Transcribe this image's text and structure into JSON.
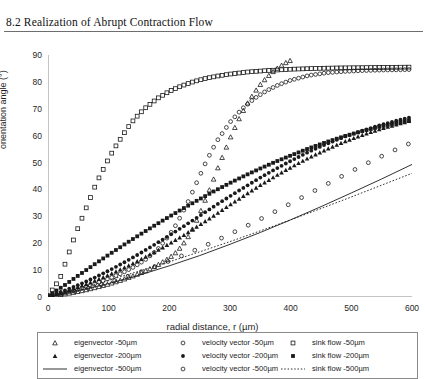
{
  "page": {
    "chapter_title": "8.2  Realization of Abrupt Contraction Flow"
  },
  "chart_data": {
    "type": "scatter",
    "title": "",
    "xlabel": "radial distance, r (µm)",
    "ylabel": "orientation angle (°)",
    "xlim": [
      0,
      600
    ],
    "ylim": [
      0,
      90
    ],
    "xticks": [
      0,
      100,
      200,
      300,
      400,
      500,
      600
    ],
    "yticks": [
      0,
      10,
      20,
      30,
      40,
      50,
      60,
      70,
      80,
      90
    ],
    "grid": false,
    "legend_position": "below-plot",
    "series": [
      {
        "name": "eigenvector -50µm",
        "marker": "open-triangle",
        "line": "none",
        "x": [
          0,
          20,
          40,
          60,
          80,
          100,
          120,
          140,
          160,
          180,
          200,
          210,
          220,
          230,
          240,
          250,
          260,
          270,
          280,
          290,
          300,
          310,
          320,
          330,
          340,
          350,
          360,
          370,
          380,
          390,
          400
        ],
        "y": [
          0.3,
          0.8,
          1.6,
          2.5,
          3.6,
          4.8,
          6.2,
          7.8,
          9.6,
          11.8,
          14.5,
          16.4,
          18.8,
          22.0,
          26.0,
          31.0,
          36.5,
          42.0,
          48.0,
          53.5,
          59.0,
          64.0,
          68.5,
          72.5,
          76.0,
          79.0,
          81.5,
          83.6,
          85.4,
          86.9,
          88.0
        ]
      },
      {
        "name": "velocity vector -50µm",
        "marker": "open-circle",
        "line": "none",
        "x": [
          0,
          20,
          40,
          60,
          80,
          100,
          120,
          140,
          160,
          180,
          200,
          210,
          220,
          230,
          240,
          250,
          260,
          270,
          280,
          300,
          320,
          340,
          360,
          380,
          400,
          430,
          460,
          490,
          520,
          550,
          580,
          600
        ],
        "y": [
          0.4,
          1.2,
          2.3,
          3.6,
          5.1,
          6.8,
          8.7,
          11.0,
          13.8,
          17.5,
          23.0,
          26.5,
          30.5,
          35.0,
          40.0,
          45.0,
          50.0,
          54.5,
          58.5,
          65.0,
          70.0,
          73.8,
          76.7,
          78.9,
          80.6,
          82.4,
          83.4,
          83.9,
          84.2,
          84.4,
          84.5,
          84.6
        ]
      },
      {
        "name": "sink flow -50µm",
        "marker": "open-square",
        "line": "none",
        "x": [
          0,
          10,
          20,
          30,
          40,
          50,
          60,
          70,
          80,
          90,
          100,
          110,
          120,
          130,
          140,
          150,
          160,
          180,
          200,
          220,
          240,
          260,
          280,
          300,
          330,
          360,
          400,
          440,
          480,
          520,
          560,
          600
        ],
        "y": [
          0.5,
          3.5,
          7.0,
          13.5,
          20.0,
          26.0,
          31.5,
          37.0,
          42.5,
          47.0,
          51.5,
          55.5,
          59.0,
          62.5,
          65.5,
          68.0,
          70.2,
          73.8,
          76.5,
          78.5,
          80.1,
          81.3,
          82.2,
          82.9,
          83.7,
          84.2,
          84.7,
          85.0,
          85.2,
          85.3,
          85.4,
          85.5
        ]
      },
      {
        "name": "eigenvector -200µm",
        "marker": "filled-triangle",
        "line": "none",
        "x": [
          0,
          25,
          50,
          75,
          100,
          125,
          150,
          175,
          200,
          225,
          250,
          275,
          300,
          325,
          350,
          375,
          400,
          430,
          460,
          490,
          520,
          550,
          580,
          600
        ],
        "y": [
          0.2,
          1.8,
          3.7,
          5.8,
          8.2,
          10.8,
          13.6,
          16.6,
          19.8,
          23.2,
          26.8,
          30.5,
          34.3,
          38.0,
          41.6,
          45.0,
          48.2,
          51.8,
          55.0,
          57.9,
          60.4,
          62.6,
          64.5,
          65.7
        ]
      },
      {
        "name": "velocity vector -200µm",
        "marker": "filled-circle",
        "line": "none",
        "x": [
          0,
          25,
          50,
          75,
          100,
          125,
          150,
          175,
          200,
          225,
          250,
          275,
          300,
          325,
          350,
          375,
          400,
          430,
          460,
          490,
          520,
          550,
          580,
          600
        ],
        "y": [
          0.3,
          2.2,
          4.5,
          7.0,
          9.8,
          12.8,
          16.0,
          19.4,
          22.9,
          26.5,
          30.2,
          33.9,
          37.5,
          41.0,
          44.4,
          47.6,
          50.6,
          54.0,
          57.0,
          59.7,
          62.0,
          64.1,
          65.9,
          67.0
        ]
      },
      {
        "name": "sink flow -200µm",
        "marker": "filled-square",
        "line": "none",
        "x": [
          0,
          25,
          50,
          75,
          100,
          125,
          150,
          175,
          200,
          225,
          250,
          275,
          300,
          325,
          350,
          375,
          400,
          430,
          460,
          490,
          520,
          550,
          580,
          600
        ],
        "y": [
          0.4,
          4.0,
          8.0,
          11.9,
          15.7,
          19.4,
          23.0,
          26.5,
          29.9,
          33.2,
          36.4,
          39.5,
          42.4,
          45.2,
          47.8,
          50.3,
          52.6,
          55.3,
          57.7,
          59.9,
          61.8,
          63.5,
          65.0,
          65.9
        ]
      },
      {
        "name": "eigenvector -500µm",
        "marker": "none",
        "line": "solid",
        "x": [
          0,
          50,
          100,
          150,
          200,
          250,
          300,
          350,
          400,
          450,
          500,
          550,
          600
        ],
        "y": [
          0.0,
          2.3,
          5.0,
          8.1,
          11.6,
          15.4,
          19.6,
          24.0,
          28.7,
          33.6,
          38.7,
          43.9,
          49.3
        ]
      },
      {
        "name": "velocity vector -500µm",
        "marker": "open-circle",
        "line": "none",
        "x": [
          0,
          30,
          60,
          90,
          120,
          150,
          180,
          210,
          240,
          270,
          300,
          330,
          360,
          390,
          420,
          450,
          480,
          510,
          540,
          570,
          600
        ],
        "y": [
          0.0,
          1.3,
          2.9,
          4.7,
          6.8,
          9.1,
          11.6,
          14.3,
          17.2,
          20.2,
          23.4,
          26.7,
          30.1,
          33.6,
          37.2,
          40.8,
          44.4,
          47.9,
          51.3,
          54.5,
          57.5
        ]
      },
      {
        "name": "sink flow -500µm",
        "marker": "none",
        "line": "dotted",
        "x": [
          0,
          50,
          100,
          150,
          200,
          250,
          300,
          350,
          400,
          450,
          500,
          550,
          600
        ],
        "y": [
          0.0,
          3.0,
          6.2,
          9.6,
          13.1,
          16.8,
          20.6,
          24.6,
          28.7,
          32.9,
          37.2,
          41.6,
          46.0
        ]
      }
    ]
  },
  "legend": {
    "items": [
      {
        "label": "eigenvector -50µm",
        "key": "open-triangle"
      },
      {
        "label": "eigenvector -200µm",
        "key": "filled-triangle"
      },
      {
        "label": "eigenvector -500µm",
        "key": "solid-line"
      },
      {
        "label": "velocity vector -50µm",
        "key": "open-circle"
      },
      {
        "label": "velocity vector -200µm",
        "key": "filled-circle"
      },
      {
        "label": "velocity vector -500µm",
        "key": "open-circle"
      },
      {
        "label": "sink flow -50µm",
        "key": "open-square"
      },
      {
        "label": "sink flow -200µm",
        "key": "filled-square"
      },
      {
        "label": "sink flow -500µm",
        "key": "dotted-line"
      }
    ]
  },
  "colors": {
    "ink": "#1a1a1a",
    "axis": "#8a8a8a",
    "rule": "#6e6e6e"
  }
}
